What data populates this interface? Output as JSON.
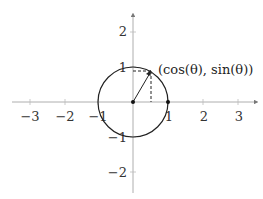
{
  "diagram": {
    "point_label": "(cos(θ), sin(θ))",
    "x_ticks": [
      {
        "value": -3,
        "label": "−3"
      },
      {
        "value": -2,
        "label": "−2"
      },
      {
        "value": -1,
        "label": "−1"
      },
      {
        "value": 1,
        "label": "1"
      },
      {
        "value": 2,
        "label": "2"
      },
      {
        "value": 3,
        "label": "3"
      }
    ],
    "y_ticks": [
      {
        "value": 2,
        "label": "2"
      },
      {
        "value": 1,
        "label": "1"
      },
      {
        "value": -1,
        "label": "−1"
      },
      {
        "value": -2,
        "label": "−2"
      }
    ],
    "circle_radius": 1,
    "theta_deg": 60,
    "colors": {
      "axis": "#999999",
      "curve": "#222222",
      "text": "#333333"
    }
  }
}
